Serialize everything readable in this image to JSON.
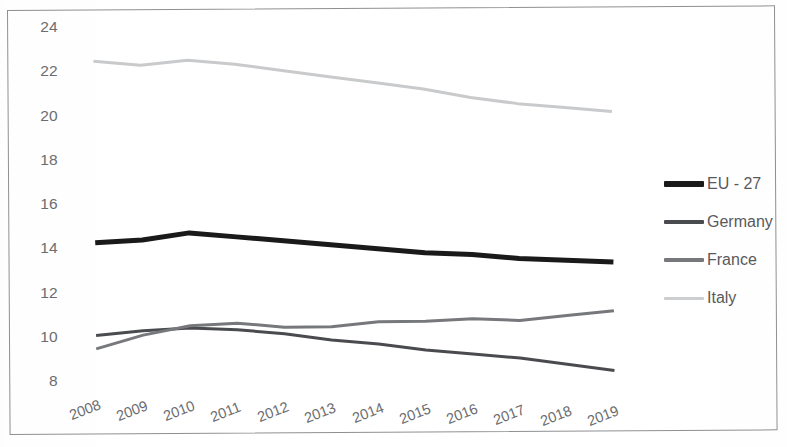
{
  "chart_data": {
    "type": "line",
    "title": "",
    "subtitle": "",
    "xlabel": "",
    "ylabel": "",
    "categories": [
      "2008",
      "2009",
      "2010",
      "2011",
      "2012",
      "2013",
      "2014",
      "2015",
      "2016",
      "2017",
      "2018",
      "2019"
    ],
    "ylim": [
      8,
      24
    ],
    "yticks": [
      8,
      10,
      12,
      14,
      16,
      18,
      20,
      22,
      24
    ],
    "grid": false,
    "legend_position": "right",
    "series": [
      {
        "name": "EU - 27",
        "color": "#1a1a1a",
        "line_width": 5,
        "values": [
          14.4,
          14.5,
          14.8,
          14.6,
          14.4,
          14.2,
          14.0,
          13.8,
          13.7,
          13.5,
          13.4,
          13.3
        ]
      },
      {
        "name": "Germany",
        "color": "#4a4b4e",
        "line_width": 3,
        "values": [
          10.2,
          10.4,
          10.5,
          10.4,
          10.2,
          9.9,
          9.7,
          9.4,
          9.2,
          9.0,
          8.7,
          8.4
        ]
      },
      {
        "name": "France",
        "color": "#77787b",
        "line_width": 3,
        "values": [
          9.6,
          10.2,
          10.6,
          10.7,
          10.5,
          10.5,
          10.7,
          10.7,
          10.8,
          10.7,
          10.9,
          11.1
        ]
      },
      {
        "name": "Italy",
        "color": "#c9cacc",
        "line_width": 3,
        "values": [
          22.6,
          22.4,
          22.6,
          22.4,
          22.1,
          21.8,
          21.5,
          21.2,
          20.8,
          20.5,
          20.3,
          20.1
        ]
      }
    ]
  },
  "legend": {
    "items": [
      {
        "label": "EU - 27",
        "color": "#1a1a1a",
        "thickness": "6px"
      },
      {
        "label": "Germany",
        "color": "#4a4b4e",
        "thickness": "4px"
      },
      {
        "label": "France",
        "color": "#77787b",
        "thickness": "4px"
      },
      {
        "label": "Italy",
        "color": "#cdced0",
        "thickness": "3px"
      }
    ]
  },
  "axes": {
    "y_tick_labels": [
      "24",
      "22",
      "20",
      "18",
      "16",
      "14",
      "12",
      "10",
      "8"
    ],
    "x_tick_labels": [
      "2008",
      "2009",
      "2010",
      "2011",
      "2012",
      "2013",
      "2014",
      "2015",
      "2016",
      "2017",
      "2018",
      "2019"
    ]
  }
}
